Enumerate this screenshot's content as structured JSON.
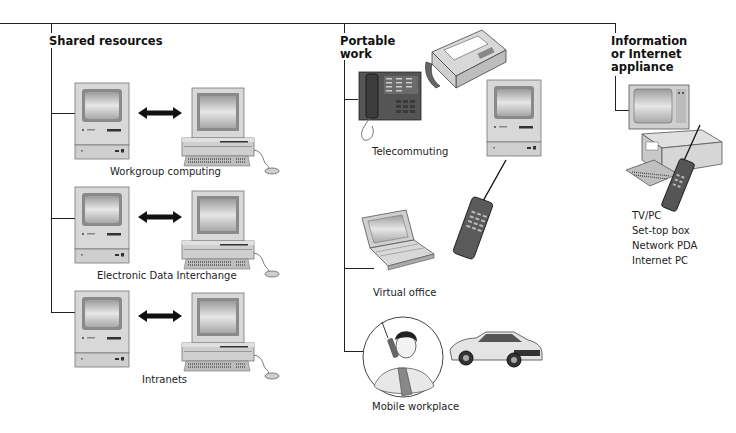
{
  "diagram": {
    "columns": [
      {
        "heading": "Shared resources",
        "items": [
          {
            "caption": "Workgroup computing"
          },
          {
            "caption": "Electronic Data Interchange"
          },
          {
            "caption": "Intranets"
          }
        ]
      },
      {
        "heading_line1": "Portable",
        "heading_line2": "work",
        "items": [
          {
            "caption": "Telecommuting"
          },
          {
            "caption": "Virtual office"
          },
          {
            "caption": "Mobile workplace"
          }
        ]
      },
      {
        "heading_line1": "Information",
        "heading_line2": "or Internet",
        "heading_line3": "appliance",
        "list": [
          "TV/PC",
          "Set-top box",
          "Network PDA",
          "Internet PC"
        ]
      }
    ],
    "icons": {
      "mac": "desktop-computer-icon",
      "pc": "pc-workstation-icon",
      "arrow": "bidirectional-arrow-icon",
      "phone": "office-phone-icon",
      "fax": "fax-machine-icon",
      "laptop": "laptop-icon",
      "cellphone": "cellular-phone-icon",
      "person": "person-on-phone-icon",
      "car": "sports-car-icon",
      "tv": "television-icon"
    }
  }
}
